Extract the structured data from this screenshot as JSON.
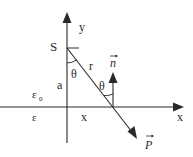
{
  "diagram": {
    "labels": {
      "source": "S",
      "y_axis": "y",
      "x_axis": "x",
      "distance_r": "r",
      "angle_1": "θ",
      "angle_2": "θ",
      "height_a": "a",
      "horizontal_x": "x",
      "medium_upper": "ε",
      "medium_upper_sub": "0",
      "medium_lower": "ε",
      "normal_vector": "n",
      "poynting_vector": "P"
    },
    "colors": {
      "line": "#2a2a2a",
      "background": "#ffffff"
    }
  }
}
